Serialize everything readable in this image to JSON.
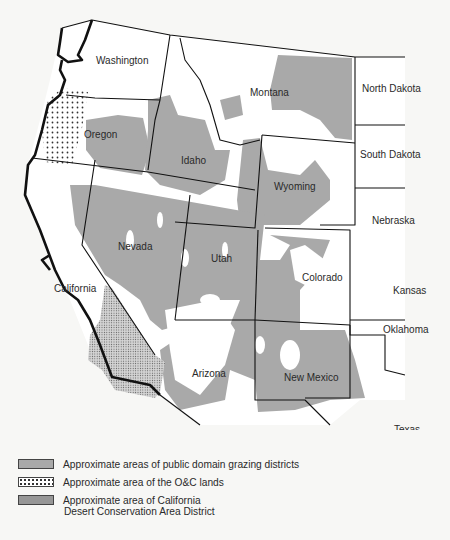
{
  "map": {
    "states": [
      {
        "name": "Washington",
        "x": 96,
        "y": 64
      },
      {
        "name": "Oregon",
        "x": 84,
        "y": 138
      },
      {
        "name": "Idaho",
        "x": 181,
        "y": 164
      },
      {
        "name": "Montana",
        "x": 250,
        "y": 96
      },
      {
        "name": "North Dakota",
        "x": 362,
        "y": 92
      },
      {
        "name": "South Dakota",
        "x": 360,
        "y": 158
      },
      {
        "name": "Wyoming",
        "x": 274,
        "y": 190
      },
      {
        "name": "Nebraska",
        "x": 372,
        "y": 224
      },
      {
        "name": "Nevada",
        "x": 118,
        "y": 250
      },
      {
        "name": "Utah",
        "x": 211,
        "y": 262
      },
      {
        "name": "Colorado",
        "x": 302,
        "y": 281
      },
      {
        "name": "Kansas",
        "x": 393,
        "y": 294
      },
      {
        "name": "California",
        "x": 54,
        "y": 292
      },
      {
        "name": "Oklahoma",
        "x": 383,
        "y": 333
      },
      {
        "name": "Arizona",
        "x": 192,
        "y": 377
      },
      {
        "name": "New Mexico",
        "x": 284,
        "y": 381
      },
      {
        "name": "Texas",
        "x": 394,
        "y": 433
      }
    ],
    "colors": {
      "grazing": "#a9a9a9",
      "border": "#111111",
      "land": "#ffffff"
    }
  },
  "legend": {
    "items": [
      {
        "label": "Approximate areas of public domain grazing districts"
      },
      {
        "label": "Approximate area of the O&C lands"
      },
      {
        "label": "Approximate area of California",
        "sub": "Desert Conservation Area District"
      }
    ]
  }
}
